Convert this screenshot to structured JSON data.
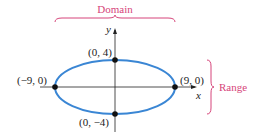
{
  "labels": {
    "domain": "Domain",
    "range": "Range",
    "x_axis": "x",
    "y_axis": "y"
  },
  "points": [
    {
      "label": "(0, 4)"
    },
    {
      "label": "(−9, 0)"
    },
    {
      "label": "(9, 0)"
    },
    {
      "label": "(0, −4)"
    }
  ],
  "colors": {
    "ellipse": "#3a86d4",
    "brace": "#d6457a",
    "axis": "#222222"
  }
}
